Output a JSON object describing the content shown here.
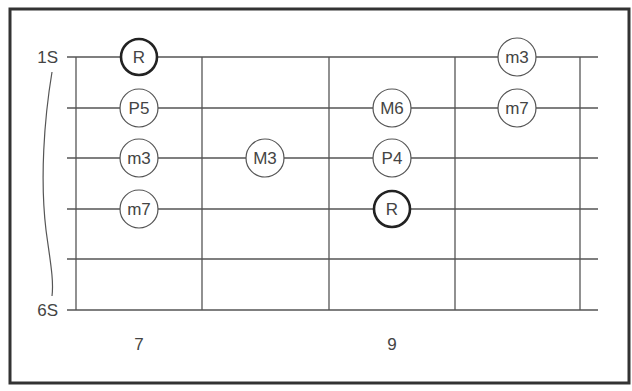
{
  "diagram": {
    "type": "guitar-fretboard-scale",
    "frame": {
      "x": 10,
      "y": 9,
      "w": 619,
      "h": 374,
      "color": "#333333"
    },
    "strings": {
      "count": 6,
      "y": [
        57,
        108,
        158,
        209,
        259,
        310
      ],
      "x_start": 67,
      "x_end": 598,
      "labels": [
        {
          "text": "1S",
          "string": 1
        },
        {
          "text": "6S",
          "string": 6
        }
      ]
    },
    "frets": {
      "x": [
        76,
        202,
        329,
        455,
        580
      ],
      "numbers": [
        {
          "text": "7",
          "x": 139
        },
        {
          "text": "9",
          "x": 392
        }
      ]
    },
    "note_columns_x": [
      139,
      265,
      392,
      517
    ],
    "notes": [
      {
        "label": "R",
        "string": 1,
        "column": 0,
        "root": true
      },
      {
        "label": "P5",
        "string": 2,
        "column": 0,
        "root": false
      },
      {
        "label": "m3",
        "string": 3,
        "column": 0,
        "root": false
      },
      {
        "label": "m7",
        "string": 4,
        "column": 0,
        "root": false
      },
      {
        "label": "M3",
        "string": 3,
        "column": 1,
        "root": false
      },
      {
        "label": "M6",
        "string": 2,
        "column": 2,
        "root": false
      },
      {
        "label": "P4",
        "string": 3,
        "column": 2,
        "root": false
      },
      {
        "label": "R",
        "string": 4,
        "column": 2,
        "root": true
      },
      {
        "label": "m3",
        "string": 1,
        "column": 3,
        "root": false
      },
      {
        "label": "m7",
        "string": 2,
        "column": 3,
        "root": false
      }
    ],
    "colors": {
      "line": "#555555",
      "text": "#444444",
      "root_ring": "#222222"
    }
  }
}
